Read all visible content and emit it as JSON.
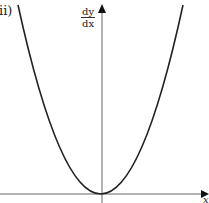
{
  "figure": {
    "part_label": "ii)",
    "y_axis_label_numerator": "dy",
    "y_axis_label_denominator": "dx",
    "x_axis_label": "x",
    "curve_description": "upward parabola with vertex at origin, touching x-axis"
  },
  "colors": {
    "curve": "#222222",
    "axes": "#555555",
    "background": "#ffffff"
  }
}
